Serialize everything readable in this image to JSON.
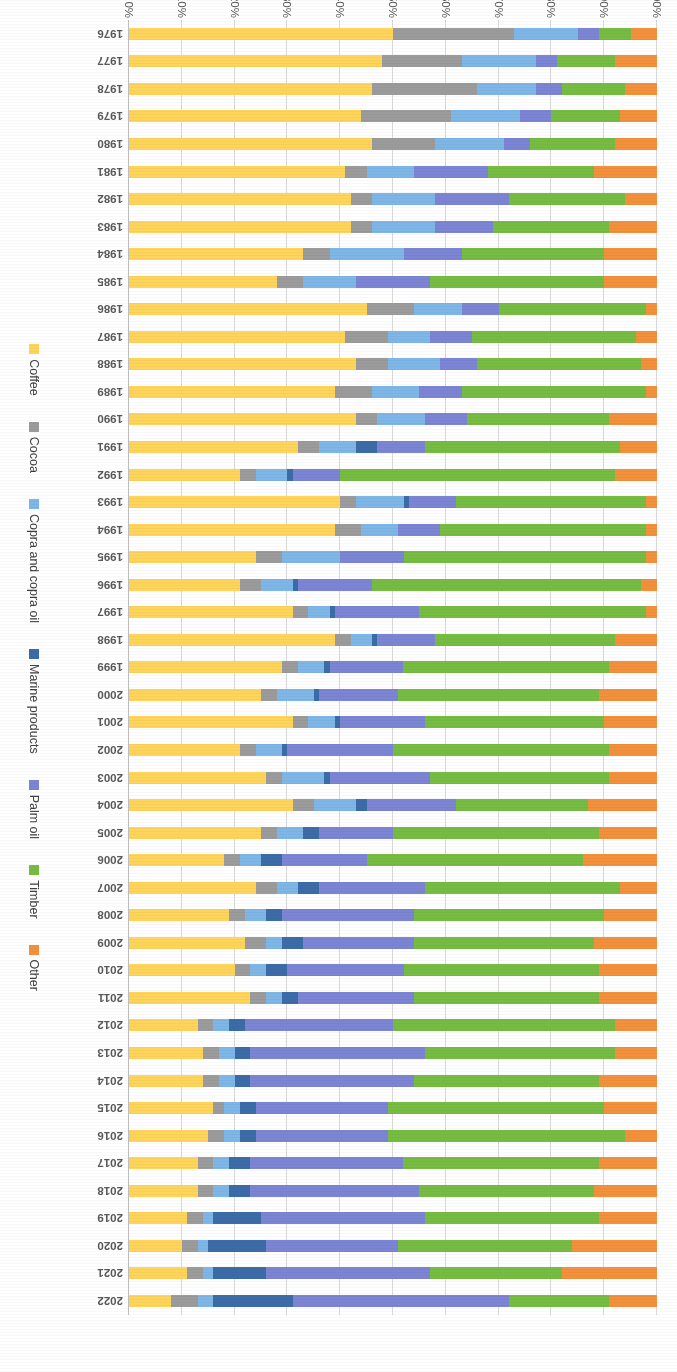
{
  "chart_data": {
    "type": "bar",
    "title": "",
    "subtitle": "",
    "xlabel": "",
    "ylabel": "",
    "stacked": true,
    "stack_mode": "percent",
    "orientation": "horizontal-rotated",
    "grid": true,
    "legend_position": "bottom",
    "ylim": [
      0,
      100
    ],
    "ytick_labels": [
      "0%",
      "10%",
      "20%",
      "30%",
      "40%",
      "50%",
      "60%",
      "70%",
      "80%",
      "90%",
      "100%"
    ],
    "ytick_values": [
      0,
      10,
      20,
      30,
      40,
      50,
      60,
      70,
      80,
      90,
      100
    ],
    "categories": [
      "1976",
      "1977",
      "1978",
      "1979",
      "1980",
      "1981",
      "1982",
      "1983",
      "1984",
      "1985",
      "1986",
      "1987",
      "1988",
      "1989",
      "1990",
      "1991",
      "1992",
      "1993",
      "1994",
      "1995",
      "1996",
      "1997",
      "1998",
      "1999",
      "2000",
      "2001",
      "2002",
      "2003",
      "2004",
      "2005",
      "2006",
      "2007",
      "2008",
      "2009",
      "2010",
      "2011",
      "2012",
      "2013",
      "2014",
      "2015",
      "2016",
      "2017",
      "2018",
      "2019",
      "2020",
      "2021",
      "2022"
    ],
    "series": [
      {
        "name": "Coffee",
        "color": "#FFD45B",
        "values": [
          50,
          48,
          46,
          44,
          46,
          40,
          41,
          42,
          32,
          28,
          45,
          41,
          43,
          39,
          43,
          32,
          21,
          40,
          39,
          24,
          21,
          31,
          39,
          29,
          25,
          31,
          21,
          26,
          31,
          25,
          18,
          24,
          19,
          22,
          20,
          23,
          13,
          14,
          14,
          16,
          15,
          13,
          13,
          11,
          10,
          11,
          8
        ]
      },
      {
        "name": "Cocoa",
        "color": "#9B9B9B",
        "values": [
          23,
          15,
          20,
          17,
          12,
          4,
          4,
          4,
          5,
          5,
          9,
          8,
          6,
          7,
          4,
          4,
          3,
          3,
          5,
          5,
          4,
          3,
          3,
          3,
          3,
          3,
          3,
          3,
          4,
          3,
          3,
          3,
          3,
          4,
          3,
          3,
          3,
          3,
          3,
          2,
          3,
          3,
          3,
          3,
          3,
          3,
          5
        ]
      },
      {
        "name": "Copra and copra oil",
        "color": "#7EB6E8",
        "values": [
          12,
          15,
          12,
          13,
          13,
          9,
          12,
          12,
          14,
          10,
          9,
          8,
          10,
          9,
          9,
          7,
          6,
          9,
          7,
          11,
          6,
          4,
          4,
          5,
          6,
          5,
          5,
          8,
          8,
          5,
          4,
          4,
          4,
          3,
          3,
          3,
          3,
          3,
          3,
          3,
          3,
          3,
          3,
          2,
          2,
          3,
          3
        ]
      },
      {
        "name": "Marine products",
        "color": "#3B6CA8"
      },
      {
        "name": "Palm oil",
        "color": "#7B85D4"
      },
      {
        "name": "Timber",
        "color": "#76BC43"
      },
      {
        "name": "Other",
        "color": "#F2903C"
      }
    ],
    "series_order_from_axis_zero": [
      "Coffee",
      "Cocoa",
      "Copra and copra oil",
      "Marine products",
      "Palm oil",
      "Timber",
      "Other"
    ],
    "data_by_year": {
      "1976": {
        "Coffee": 50,
        "Cocoa": 23,
        "Copra and copra oil": 12,
        "Marine products": 0,
        "Palm oil": 4,
        "Timber": 6,
        "Other": 5
      },
      "1977": {
        "Coffee": 48,
        "Cocoa": 15,
        "Copra and copra oil": 14,
        "Marine products": 0,
        "Palm oil": 4,
        "Timber": 11,
        "Other": 8
      },
      "1978": {
        "Coffee": 46,
        "Cocoa": 20,
        "Copra and copra oil": 11,
        "Marine products": 0,
        "Palm oil": 5,
        "Timber": 12,
        "Other": 6
      },
      "1979": {
        "Coffee": 44,
        "Cocoa": 17,
        "Copra and copra oil": 13,
        "Marine products": 0,
        "Palm oil": 6,
        "Timber": 13,
        "Other": 7
      },
      "1980": {
        "Coffee": 46,
        "Cocoa": 12,
        "Copra and copra oil": 13,
        "Marine products": 0,
        "Palm oil": 5,
        "Timber": 16,
        "Other": 8
      },
      "1981": {
        "Coffee": 41,
        "Cocoa": 4,
        "Copra and copra oil": 9,
        "Marine products": 0,
        "Palm oil": 14,
        "Timber": 20,
        "Other": 12
      },
      "1982": {
        "Coffee": 42,
        "Cocoa": 4,
        "Copra and copra oil": 12,
        "Marine products": 0,
        "Palm oil": 14,
        "Timber": 22,
        "Other": 6
      },
      "1983": {
        "Coffee": 42,
        "Cocoa": 4,
        "Copra and copra oil": 12,
        "Marine products": 0,
        "Palm oil": 11,
        "Timber": 22,
        "Other": 9
      },
      "1984": {
        "Coffee": 33,
        "Cocoa": 5,
        "Copra and copra oil": 14,
        "Marine products": 0,
        "Palm oil": 11,
        "Timber": 27,
        "Other": 10
      },
      "1985": {
        "Coffee": 28,
        "Cocoa": 5,
        "Copra and copra oil": 10,
        "Marine products": 0,
        "Palm oil": 14,
        "Timber": 33,
        "Other": 10
      },
      "1986": {
        "Coffee": 45,
        "Cocoa": 9,
        "Copra and copra oil": 9,
        "Marine products": 0,
        "Palm oil": 7,
        "Timber": 28,
        "Other": 2
      },
      "1987": {
        "Coffee": 41,
        "Cocoa": 8,
        "Copra and copra oil": 8,
        "Marine products": 0,
        "Palm oil": 8,
        "Timber": 31,
        "Other": 4
      },
      "1988": {
        "Coffee": 43,
        "Cocoa": 6,
        "Copra and copra oil": 10,
        "Marine products": 0,
        "Palm oil": 7,
        "Timber": 31,
        "Other": 3
      },
      "1989": {
        "Coffee": 39,
        "Cocoa": 7,
        "Copra and copra oil": 9,
        "Marine products": 0,
        "Palm oil": 8,
        "Timber": 35,
        "Other": 2
      },
      "1990": {
        "Coffee": 43,
        "Cocoa": 4,
        "Copra and copra oil": 9,
        "Marine products": 0,
        "Palm oil": 8,
        "Timber": 27,
        "Other": 9
      },
      "1991": {
        "Coffee": 32,
        "Cocoa": 4,
        "Copra and copra oil": 7,
        "Marine products": 4,
        "Palm oil": 9,
        "Timber": 37,
        "Other": 7
      },
      "1992": {
        "Coffee": 21,
        "Cocoa": 3,
        "Copra and copra oil": 6,
        "Marine products": 1,
        "Palm oil": 9,
        "Timber": 52,
        "Other": 8
      },
      "1993": {
        "Coffee": 40,
        "Cocoa": 3,
        "Copra and copra oil": 9,
        "Marine products": 1,
        "Palm oil": 9,
        "Timber": 36,
        "Other": 2
      },
      "1994": {
        "Coffee": 39,
        "Cocoa": 5,
        "Copra and copra oil": 7,
        "Marine products": 0,
        "Palm oil": 8,
        "Timber": 39,
        "Other": 2
      },
      "1995": {
        "Coffee": 24,
        "Cocoa": 5,
        "Copra and copra oil": 11,
        "Marine products": 0,
        "Palm oil": 12,
        "Timber": 46,
        "Other": 2
      },
      "1996": {
        "Coffee": 21,
        "Cocoa": 4,
        "Copra and copra oil": 6,
        "Marine products": 1,
        "Palm oil": 14,
        "Timber": 51,
        "Other": 3
      },
      "1997": {
        "Coffee": 31,
        "Cocoa": 3,
        "Copra and copra oil": 4,
        "Marine products": 1,
        "Palm oil": 16,
        "Timber": 43,
        "Other": 2
      },
      "1998": {
        "Coffee": 39,
        "Cocoa": 3,
        "Copra and copra oil": 4,
        "Marine products": 1,
        "Palm oil": 11,
        "Timber": 34,
        "Other": 8
      },
      "1999": {
        "Coffee": 29,
        "Cocoa": 3,
        "Copra and copra oil": 5,
        "Marine products": 1,
        "Palm oil": 14,
        "Timber": 39,
        "Other": 9
      },
      "2000": {
        "Coffee": 25,
        "Cocoa": 3,
        "Copra and copra oil": 7,
        "Marine products": 1,
        "Palm oil": 15,
        "Timber": 38,
        "Other": 11
      },
      "2001": {
        "Coffee": 31,
        "Cocoa": 3,
        "Copra and copra oil": 5,
        "Marine products": 1,
        "Palm oil": 16,
        "Timber": 34,
        "Other": 10
      },
      "2002": {
        "Coffee": 21,
        "Cocoa": 3,
        "Copra and copra oil": 5,
        "Marine products": 1,
        "Palm oil": 20,
        "Timber": 41,
        "Other": 9
      },
      "2003": {
        "Coffee": 26,
        "Cocoa": 3,
        "Copra and copra oil": 8,
        "Marine products": 1,
        "Palm oil": 19,
        "Timber": 34,
        "Other": 9
      },
      "2004": {
        "Coffee": 31,
        "Cocoa": 4,
        "Copra and copra oil": 8,
        "Marine products": 2,
        "Palm oil": 17,
        "Timber": 25,
        "Other": 13
      },
      "2005": {
        "Coffee": 25,
        "Cocoa": 3,
        "Copra and copra oil": 5,
        "Marine products": 3,
        "Palm oil": 14,
        "Timber": 39,
        "Other": 11
      },
      "2006": {
        "Coffee": 18,
        "Cocoa": 3,
        "Copra and copra oil": 4,
        "Marine products": 4,
        "Palm oil": 16,
        "Timber": 41,
        "Other": 14
      },
      "2007": {
        "Coffee": 24,
        "Cocoa": 4,
        "Copra and copra oil": 4,
        "Marine products": 4,
        "Palm oil": 20,
        "Timber": 37,
        "Other": 7
      },
      "2008": {
        "Coffee": 19,
        "Cocoa": 3,
        "Copra and copra oil": 4,
        "Marine products": 3,
        "Palm oil": 25,
        "Timber": 36,
        "Other": 10
      },
      "2009": {
        "Coffee": 22,
        "Cocoa": 4,
        "Copra and copra oil": 3,
        "Marine products": 4,
        "Palm oil": 21,
        "Timber": 34,
        "Other": 12
      },
      "2010": {
        "Coffee": 20,
        "Cocoa": 3,
        "Copra and copra oil": 3,
        "Marine products": 4,
        "Palm oil": 22,
        "Timber": 37,
        "Other": 11
      },
      "2011": {
        "Coffee": 23,
        "Cocoa": 3,
        "Copra and copra oil": 3,
        "Marine products": 3,
        "Palm oil": 22,
        "Timber": 35,
        "Other": 11
      },
      "2012": {
        "Coffee": 13,
        "Cocoa": 3,
        "Copra and copra oil": 3,
        "Marine products": 3,
        "Palm oil": 28,
        "Timber": 42,
        "Other": 8
      },
      "2013": {
        "Coffee": 14,
        "Cocoa": 3,
        "Copra and copra oil": 3,
        "Marine products": 3,
        "Palm oil": 33,
        "Timber": 36,
        "Other": 8
      },
      "2014": {
        "Coffee": 14,
        "Cocoa": 3,
        "Copra and copra oil": 3,
        "Marine products": 3,
        "Palm oil": 31,
        "Timber": 35,
        "Other": 11
      },
      "2015": {
        "Coffee": 16,
        "Cocoa": 2,
        "Copra and copra oil": 3,
        "Marine products": 3,
        "Palm oil": 25,
        "Timber": 41,
        "Other": 10
      },
      "2016": {
        "Coffee": 15,
        "Cocoa": 3,
        "Copra and copra oil": 3,
        "Marine products": 3,
        "Palm oil": 25,
        "Timber": 45,
        "Other": 6
      },
      "2017": {
        "Coffee": 13,
        "Cocoa": 3,
        "Copra and copra oil": 3,
        "Marine products": 4,
        "Palm oil": 29,
        "Timber": 37,
        "Other": 11
      },
      "2018": {
        "Coffee": 13,
        "Cocoa": 3,
        "Copra and copra oil": 3,
        "Marine products": 4,
        "Palm oil": 32,
        "Timber": 33,
        "Other": 12
      },
      "2019": {
        "Coffee": 11,
        "Cocoa": 3,
        "Copra and copra oil": 2,
        "Marine products": 9,
        "Palm oil": 31,
        "Timber": 33,
        "Other": 11
      },
      "2020": {
        "Coffee": 10,
        "Cocoa": 3,
        "Copra and copra oil": 2,
        "Marine products": 11,
        "Palm oil": 25,
        "Timber": 33,
        "Other": 16
      },
      "2021": {
        "Coffee": 11,
        "Cocoa": 3,
        "Copra and copra oil": 2,
        "Marine products": 10,
        "Palm oil": 31,
        "Timber": 25,
        "Other": 18
      },
      "2022": {
        "Coffee": 8,
        "Cocoa": 5,
        "Copra and copra oil": 3,
        "Marine products": 15,
        "Palm oil": 41,
        "Timber": 19,
        "Other": 9
      }
    }
  },
  "legend": {
    "items": [
      {
        "label": "Coffee",
        "color": "#FFD45B"
      },
      {
        "label": "Cocoa",
        "color": "#9B9B9B"
      },
      {
        "label": "Copra and copra oil",
        "color": "#7EB6E8"
      },
      {
        "label": "Marine products",
        "color": "#3B6CA8"
      },
      {
        "label": "Palm oil",
        "color": "#7B85D4"
      },
      {
        "label": "Timber",
        "color": "#76BC43"
      },
      {
        "label": "Other",
        "color": "#F2903C"
      }
    ]
  }
}
